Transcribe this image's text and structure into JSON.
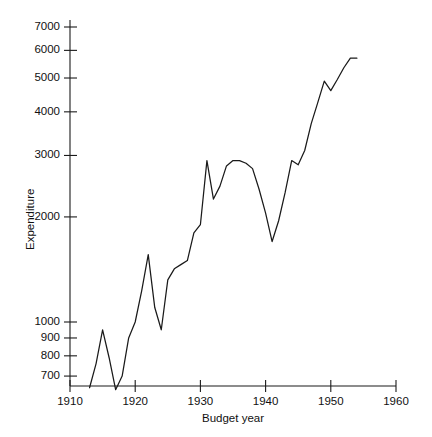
{
  "chart_data": {
    "type": "line",
    "title": "",
    "xlabel": "Budget year",
    "ylabel": "Expenditure",
    "yscale": "log",
    "xlim": [
      1910,
      1960
    ],
    "ylim": [
      620,
      7000
    ],
    "grid": false,
    "legend": null,
    "xticks": [
      1910,
      1920,
      1930,
      1940,
      1950,
      1960
    ],
    "xtick_labels": [
      "1910",
      "1920",
      "1930",
      "1940",
      "1950",
      "1960"
    ],
    "yticks": [
      700,
      800,
      900,
      1000,
      2000,
      3000,
      4000,
      5000,
      6000,
      7000
    ],
    "ytick_labels": [
      "700",
      "800",
      "900",
      "1000",
      "2000",
      "3000",
      "4000",
      "5000",
      "6000",
      "7000"
    ],
    "series": [
      {
        "name": "Expenditure",
        "color": "#1a1a1a",
        "x": [
          1913,
          1914,
          1915,
          1916,
          1917,
          1918,
          1919,
          1920,
          1921,
          1922,
          1923,
          1924,
          1925,
          1926,
          1927,
          1928,
          1929,
          1930,
          1931,
          1932,
          1933,
          1934,
          1935,
          1936,
          1937,
          1938,
          1939,
          1940,
          1941,
          1942,
          1943,
          1944,
          1945,
          1946,
          1947,
          1948,
          1949,
          1950,
          1951,
          1952,
          1953,
          1954
        ],
        "y": [
          648,
          760,
          950,
          790,
          640,
          700,
          900,
          1000,
          1230,
          1560,
          1100,
          950,
          1320,
          1420,
          1460,
          1500,
          1800,
          1900,
          2900,
          2250,
          2450,
          2800,
          2900,
          2900,
          2850,
          2750,
          2400,
          2050,
          1700,
          1950,
          2350,
          2900,
          2820,
          3100,
          3700,
          4250,
          4900,
          4600,
          4950,
          5350,
          5700,
          5700
        ]
      }
    ]
  },
  "axes": {
    "ylabel_text": "Expenditure",
    "xlabel_text": "Budget year"
  }
}
